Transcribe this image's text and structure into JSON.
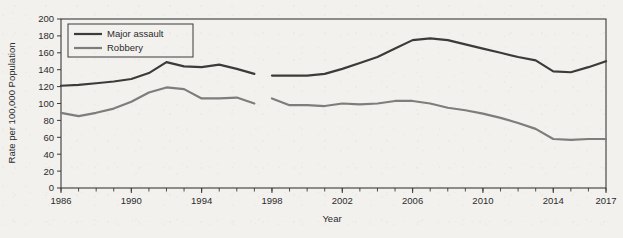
{
  "chart_data": {
    "type": "line",
    "title": "",
    "xlabel": "Year",
    "ylabel": "Rate per 100,000 Population",
    "xlim": [
      1986,
      2017
    ],
    "ylim": [
      0,
      200
    ],
    "ytick_step": 20,
    "grid": false,
    "legend_position": "top-left",
    "x_tick_labels": [
      "1986",
      "1990",
      "1994",
      "1998",
      "2002",
      "2006",
      "2010",
      "2014",
      "2017"
    ],
    "x_tick_values": [
      1986,
      1990,
      1994,
      1998,
      2002,
      2006,
      2010,
      2014,
      2017
    ],
    "x_minor_ticks_every": 1,
    "y_tick_labels": [
      "0",
      "20",
      "40",
      "60",
      "80",
      "100",
      "120",
      "140",
      "160",
      "180",
      "200"
    ],
    "y_tick_values": [
      0,
      20,
      40,
      60,
      80,
      100,
      120,
      140,
      160,
      180,
      200
    ],
    "x": [
      1986,
      1987,
      1988,
      1989,
      1990,
      1991,
      1992,
      1993,
      1994,
      1995,
      1996,
      1997,
      1998,
      1999,
      2000,
      2001,
      2002,
      2003,
      2004,
      2005,
      2006,
      2007,
      2008,
      2009,
      2010,
      2011,
      2012,
      2013,
      2014,
      2015,
      2016,
      2017
    ],
    "series": [
      {
        "name": "Major assault",
        "color": "#3b3b3b",
        "line_width": 2.2,
        "segments": [
          {
            "x": [
              1986,
              1987,
              1988,
              1989,
              1990,
              1991,
              1992,
              1993,
              1994,
              1995,
              1996,
              1997
            ],
            "values": [
              121,
              122,
              124,
              126,
              129,
              136,
              149,
              144,
              143,
              146,
              141,
              135
            ]
          },
          {
            "x": [
              1998,
              1999,
              2000,
              2001,
              2002,
              2003,
              2004,
              2005,
              2006,
              2007,
              2008,
              2009,
              2010,
              2011,
              2012,
              2013,
              2014,
              2015,
              2016,
              2017
            ],
            "values": [
              133,
              133,
              133,
              135,
              141,
              148,
              155,
              165,
              175,
              177,
              175,
              170,
              165,
              160,
              155,
              151,
              138,
              137,
              143,
              150
            ]
          }
        ]
      },
      {
        "name": "Robbery",
        "color": "#7d7d7d",
        "line_width": 2.2,
        "segments": [
          {
            "x": [
              1986,
              1987,
              1988,
              1989,
              1990,
              1991,
              1992,
              1993,
              1994,
              1995,
              1996,
              1997
            ],
            "values": [
              89,
              85,
              89,
              94,
              102,
              113,
              119,
              117,
              106,
              106,
              107,
              100
            ]
          },
          {
            "x": [
              1998,
              1999,
              2000,
              2001,
              2002,
              2003,
              2004,
              2005,
              2006,
              2007,
              2008,
              2009,
              2010,
              2011,
              2012,
              2013,
              2014,
              2015,
              2016,
              2017
            ],
            "values": [
              106,
              98,
              98,
              97,
              100,
              99,
              100,
              103,
              103,
              100,
              95,
              92,
              88,
              83,
              77,
              70,
              58,
              57,
              58,
              58
            ]
          }
        ]
      }
    ],
    "break_note": "Discontinuity between 1997 and 1998 in both series"
  },
  "legend": {
    "items": [
      {
        "label": "Major assault",
        "color": "#3b3b3b"
      },
      {
        "label": "Robbery",
        "color": "#7d7d7d"
      }
    ]
  },
  "colors": {
    "background": "#f2f1ee",
    "axis": "#3a3a3a",
    "text": "#2b2b2b",
    "major_assault": "#3b3b3b",
    "robbery": "#7d7d7d"
  }
}
